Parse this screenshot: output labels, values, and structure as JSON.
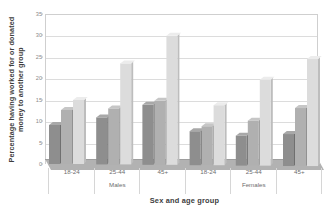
{
  "chart_data": {
    "type": "bar",
    "title": "",
    "xlabel": "Sex and age group",
    "ylabel": "Percentage having worked for or donated money to another group",
    "ylabel_line1": "Percentage having worked for or donated",
    "ylabel_line2": "money to another group",
    "ylim": [
      0,
      35
    ],
    "yticks": [
      0,
      5,
      10,
      15,
      20,
      25,
      30,
      35
    ],
    "ytick_labels": [
      "0",
      "5",
      "10",
      "15",
      "20",
      "25",
      "30",
      "35"
    ],
    "grid": true,
    "legend": "none",
    "categories": [
      "18-24",
      "25-44",
      "45+",
      "18-24",
      "25-44",
      "45+"
    ],
    "supercategories": [
      "Males",
      "Females"
    ],
    "series": [
      {
        "name": "series-1",
        "color": "#8e8e8e",
        "values": [
          9,
          11,
          14,
          8,
          7,
          7.5
        ]
      },
      {
        "name": "series-2",
        "color": "#b0b0b0",
        "values": [
          12.5,
          13,
          15,
          9,
          10.5,
          13.5
        ]
      },
      {
        "name": "series-3",
        "color": "#dcdcdc",
        "values": [
          15,
          23.5,
          30,
          14,
          20,
          25
        ]
      }
    ],
    "groups": [
      {
        "sex": "Males",
        "age": "18-24",
        "values": [
          9,
          12.5,
          15
        ]
      },
      {
        "sex": "Males",
        "age": "25-44",
        "values": [
          11,
          13,
          23.5
        ]
      },
      {
        "sex": "Males",
        "age": "45+",
        "values": [
          14,
          15,
          30
        ]
      },
      {
        "sex": "Females",
        "age": "18-24",
        "values": [
          8,
          9,
          14
        ]
      },
      {
        "sex": "Females",
        "age": "25-44",
        "values": [
          7,
          10.5,
          20
        ]
      },
      {
        "sex": "Females",
        "age": "45+",
        "values": [
          7.5,
          13.5,
          25
        ]
      }
    ],
    "colors": {
      "series1_face": "#8e8e8e",
      "series1_top": "#a8a8a8",
      "series1_side": "#6f6f6f",
      "series2_face": "#b0b0b0",
      "series2_top": "#c6c6c6",
      "series2_side": "#919191",
      "series3_face": "#dcdcdc",
      "series3_top": "#ececec",
      "series3_side": "#bdbdbd",
      "gridline": "#dcdcdc",
      "frame": "#cfcfcf",
      "floor": "#b2b2b2",
      "text": "#6d6d6d",
      "title_text": "#3d3d3d",
      "background": "#ffffff"
    }
  }
}
